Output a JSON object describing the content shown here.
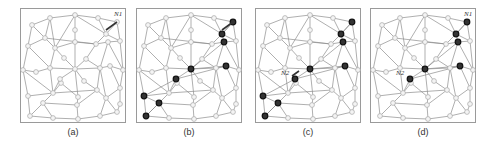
{
  "figure": {
    "panels": [
      {
        "id": "a",
        "caption": "(a)",
        "x": 20,
        "highlighted": [],
        "labels": [
          {
            "text": "N1",
            "node": 4
          }
        ],
        "arrows": [
          {
            "from": [
              86,
              22
            ],
            "to": [
              97,
              14
            ]
          }
        ]
      },
      {
        "id": "b",
        "caption": "(b)",
        "x": 136,
        "highlighted": [
          4,
          10,
          15,
          19,
          21,
          24,
          27,
          31,
          35
        ],
        "labels": [],
        "arrows": [
          {
            "from": [
              86,
              22
            ],
            "to": [
              97,
              14
            ]
          }
        ]
      },
      {
        "id": "c",
        "caption": "(c)",
        "x": 255,
        "highlighted": [
          4,
          10,
          15,
          19,
          21,
          24,
          27,
          31,
          35
        ],
        "labels": [
          {
            "text": "N2",
            "node": 24
          }
        ],
        "arrows": [
          {
            "from": [
              37,
              68
            ],
            "to": [
              44,
              63
            ]
          }
        ]
      },
      {
        "id": "d",
        "caption": "(d)",
        "x": 370,
        "highlighted": [
          4,
          10,
          15,
          19,
          21,
          24
        ],
        "labels": [
          {
            "text": "N1",
            "node": 4
          },
          {
            "text": "N2",
            "node": 24
          }
        ],
        "arrows": []
      }
    ],
    "mesh": {
      "nodes": [
        [
          12,
          17
        ],
        [
          30,
          10
        ],
        [
          55,
          7
        ],
        [
          78,
          10
        ],
        [
          97,
          14
        ],
        [
          8,
          38
        ],
        [
          25,
          30
        ],
        [
          35,
          40
        ],
        [
          55,
          22
        ],
        [
          55,
          34
        ],
        [
          86,
          26
        ],
        [
          100,
          33
        ],
        [
          44,
          50
        ],
        [
          66,
          51
        ],
        [
          76,
          36
        ],
        [
          88,
          34
        ],
        [
          3,
          62
        ],
        [
          16,
          64
        ],
        [
          30,
          60
        ],
        [
          55,
          61
        ],
        [
          80,
          60
        ],
        [
          90,
          58
        ],
        [
          103,
          62
        ],
        [
          41,
          75
        ],
        [
          40,
          71
        ],
        [
          64,
          73
        ],
        [
          33,
          85
        ],
        [
          8,
          88
        ],
        [
          58,
          89
        ],
        [
          77,
          82
        ],
        [
          100,
          80
        ],
        [
          23,
          95
        ],
        [
          86,
          90
        ],
        [
          57,
          97
        ],
        [
          100,
          96
        ],
        [
          10,
          108
        ],
        [
          33,
          110
        ],
        [
          58,
          111
        ],
        [
          80,
          108
        ],
        [
          97,
          104
        ]
      ],
      "edges": [
        [
          0,
          1
        ],
        [
          1,
          2
        ],
        [
          2,
          3
        ],
        [
          3,
          4
        ],
        [
          0,
          5
        ],
        [
          0,
          6
        ],
        [
          1,
          6
        ],
        [
          1,
          7
        ],
        [
          2,
          8
        ],
        [
          2,
          7
        ],
        [
          2,
          10
        ],
        [
          3,
          10
        ],
        [
          4,
          11
        ],
        [
          4,
          10
        ],
        [
          5,
          6
        ],
        [
          6,
          7
        ],
        [
          7,
          9
        ],
        [
          8,
          9
        ],
        [
          9,
          14
        ],
        [
          10,
          14
        ],
        [
          10,
          11
        ],
        [
          14,
          15
        ],
        [
          11,
          15
        ],
        [
          6,
          14
        ],
        [
          5,
          16
        ],
        [
          5,
          18
        ],
        [
          7,
          18
        ],
        [
          7,
          12
        ],
        [
          12,
          19
        ],
        [
          9,
          19
        ],
        [
          13,
          19
        ],
        [
          14,
          13
        ],
        [
          15,
          20
        ],
        [
          15,
          22
        ],
        [
          11,
          22
        ],
        [
          20,
          13
        ],
        [
          16,
          17
        ],
        [
          17,
          18
        ],
        [
          18,
          19
        ],
        [
          19,
          20
        ],
        [
          20,
          21
        ],
        [
          21,
          22
        ],
        [
          16,
          27
        ],
        [
          16,
          26
        ],
        [
          18,
          26
        ],
        [
          19,
          24
        ],
        [
          24,
          26
        ],
        [
          19,
          25
        ],
        [
          19,
          28
        ],
        [
          20,
          29
        ],
        [
          21,
          30
        ],
        [
          22,
          30
        ],
        [
          20,
          32
        ],
        [
          26,
          27
        ],
        [
          26,
          31
        ],
        [
          26,
          29
        ],
        [
          27,
          35
        ],
        [
          31,
          35
        ],
        [
          31,
          36
        ],
        [
          26,
          23
        ],
        [
          25,
          29
        ],
        [
          29,
          32
        ],
        [
          30,
          32
        ],
        [
          30,
          34
        ],
        [
          28,
          33
        ],
        [
          29,
          33
        ],
        [
          33,
          37
        ],
        [
          32,
          38
        ],
        [
          32,
          39
        ],
        [
          34,
          39
        ],
        [
          31,
          33
        ],
        [
          35,
          36
        ],
        [
          36,
          37
        ],
        [
          37,
          38
        ],
        [
          38,
          39
        ],
        [
          23,
          28
        ]
      ]
    }
  }
}
